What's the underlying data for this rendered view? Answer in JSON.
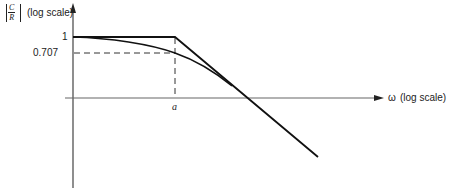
{
  "diagram": {
    "type": "bode-magnitude-plot",
    "y_axis": {
      "label_fraction_numerator": "C",
      "label_fraction_denominator": "R",
      "label_suffix": "(log scale)",
      "ticks": [
        "1",
        "0.707"
      ]
    },
    "x_axis": {
      "symbol": "ω",
      "label_suffix": "(log scale)",
      "ticks": [
        "a"
      ]
    },
    "curves": [
      {
        "name": "asymptotic-approximation",
        "description": "flat at 1 until corner frequency a, then straight-line rolloff"
      },
      {
        "name": "actual-response",
        "description": "smooth curve passing through 0.707 at ω = a, approaching the asymptote"
      }
    ],
    "colors": {
      "line": "#222222",
      "axis": "#555555",
      "background": "#ffffff"
    }
  }
}
